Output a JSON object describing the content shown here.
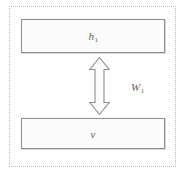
{
  "figure": {
    "name": "rbm-layer-diagram",
    "background_color": "#ffffff",
    "frame": {
      "name": "outer-dotted-frame",
      "style": "dotted",
      "color": "#b9b9b9"
    },
    "blocks": [
      {
        "id": "hidden-layer",
        "label_text": "h",
        "label_subscript": "1",
        "fill_color": "#fbfbfb",
        "border_color": "#8c8c8c"
      },
      {
        "id": "visible-layer",
        "label_text": "v",
        "label_subscript": "",
        "fill_color": "#fbfbfb",
        "border_color": "#8c8c8c"
      }
    ],
    "connector": {
      "id": "weight-connector",
      "icon": "double-headed-vertical-arrow",
      "label_text": "W",
      "label_subscript": "1",
      "stroke_color": "#8c8c8c",
      "fill_color": "#fdfdfd"
    }
  }
}
